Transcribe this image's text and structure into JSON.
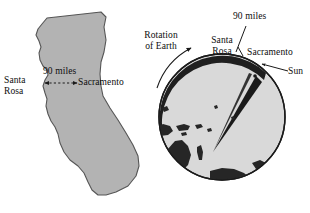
{
  "figure": {
    "background_color": "#ffffff",
    "width": 310,
    "height": 213
  },
  "california_map": {
    "name": "California state outline",
    "fill_color": "#b3b3b3",
    "stroke_color": "#4d4d4d",
    "distance_label": "90 miles",
    "city_west_label_line1": "Santa",
    "city_west_label_line2": "Rosa",
    "city_east_label": "Sacramento",
    "arrow_style": "double-headed-dotted"
  },
  "globe": {
    "name": "Earth viewed from above the north pole",
    "fill_color": "#d9d9d9",
    "outline_color": "#1a1a1a",
    "land_color": "#262626",
    "terminator_color": "#1a1a1a",
    "rotation_label_line1": "Rotation",
    "rotation_label_line2": "of Earth",
    "santa_rosa_label_line1": "Santa",
    "santa_rosa_label_line2": "Rosa",
    "distance_label": "90 miles",
    "sacramento_label": "Sacramento",
    "sun_label": "Sun",
    "rotation_direction": "counterclockwise",
    "sun_direction": "from the right"
  }
}
